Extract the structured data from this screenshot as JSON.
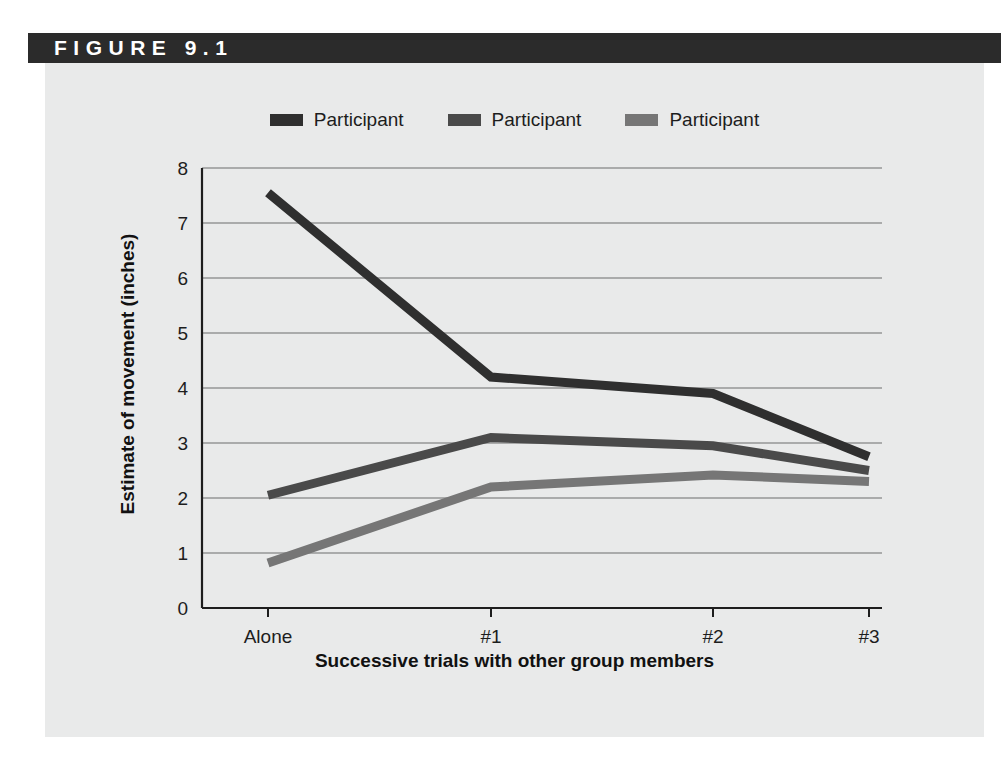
{
  "figure": {
    "header_label": "FIGURE 9.1",
    "header_bg": "#2b2b2b",
    "panel_bg": "#e9eaea",
    "page_bg": "#ffffff"
  },
  "legend": {
    "position": "top-center",
    "items": [
      {
        "label": "Participant",
        "color": "#2f2f2f",
        "swatch": "legend-swatch-participant-1"
      },
      {
        "label": "Participant",
        "color": "#4a4a4a",
        "swatch": "legend-swatch-participant-2"
      },
      {
        "label": "Participant",
        "color": "#767676",
        "swatch": "legend-swatch-participant-3"
      }
    ]
  },
  "axes": {
    "y_title": "Estimate of movement (inches)",
    "x_title": "Successive trials with other group members",
    "y_ticks": [
      "0",
      "1",
      "2",
      "3",
      "4",
      "5",
      "6",
      "7",
      "8"
    ],
    "x_ticks": [
      "Alone",
      "#1",
      "#2",
      "#3"
    ],
    "axis_color": "#1d1d1d",
    "grid_color": "#6d6d6d"
  },
  "chart_data": {
    "type": "line",
    "title": "FIGURE 9.1",
    "xlabel": "Successive trials with other group members",
    "ylabel": "Estimate of movement (inches)",
    "categories": [
      "Alone",
      "#1",
      "#2",
      "#3"
    ],
    "ylim": [
      0,
      8
    ],
    "xlim_categories": 4,
    "grid": true,
    "grid_axis": "y",
    "legend_position": "top-center",
    "yticks": [
      0,
      1,
      2,
      3,
      4,
      5,
      6,
      7,
      8
    ],
    "series": [
      {
        "name": "Participant",
        "color": "#2f2f2f",
        "values": [
          7.55,
          4.2,
          3.9,
          2.75
        ]
      },
      {
        "name": "Participant",
        "color": "#4a4a4a",
        "values": [
          2.05,
          3.1,
          2.95,
          2.5
        ]
      },
      {
        "name": "Participant",
        "color": "#767676",
        "values": [
          0.82,
          2.2,
          2.42,
          2.3
        ]
      }
    ]
  }
}
